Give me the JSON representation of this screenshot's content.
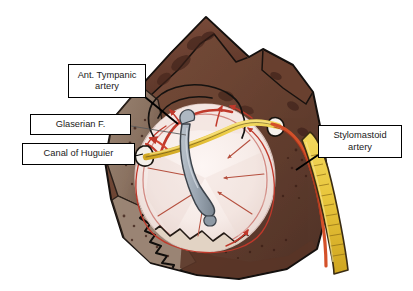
{
  "figure": {
    "background_color": "#ffffff",
    "width": 413,
    "height": 291
  },
  "labels": {
    "ant_tympanic": "Ant. Tympanic\nartery",
    "glaserian": "Glaserian F.",
    "huguier": "Canal of Huguier",
    "stylomastoid": "Stylomastoid\nartery"
  },
  "anatomy": {
    "bone_mass": "temporal-bone",
    "tympanic_membrane": "tympanic-membrane",
    "malleus_handle": "malleus-handle",
    "chorda_tympani": "chorda-tympani-nerve",
    "facial_nerve": "facial-nerve",
    "stylomastoid_vessel": "stylomastoid-artery-vessel",
    "anterior_tympanic_vessel": "anterior-tympanic-artery-vessel"
  },
  "colors": {
    "bone_dark": "#5d3a2e",
    "bone_mid": "#6f4838",
    "bone_light": "#8d7363",
    "bone_pale": "#a89684",
    "bone_shadow": "#432a22",
    "membrane": "#f7ece9",
    "membrane_shade": "#e9d8d3",
    "malleus": "#9aa5b0",
    "nerve_yellow": "#e9c63c",
    "artery_red": "#c0392b",
    "artery_orange": "#e2732a",
    "outline": "#1a1a1a",
    "leader": "#000000",
    "box_border": "#000000",
    "box_fill": "#ffffff",
    "text": "#1a1a1a"
  }
}
